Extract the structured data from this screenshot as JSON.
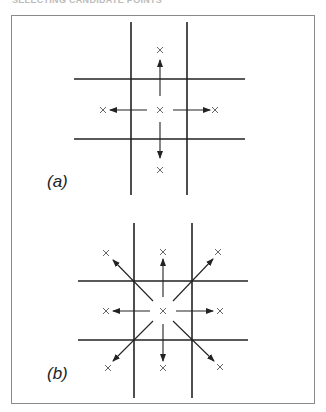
{
  "header": {
    "title": "SELECTING CANDIDATE POINTS"
  },
  "panels": [
    {
      "id": "a",
      "label": "(a)",
      "description": "4-neighbour search: center point with arrows to up, down, left, right candidates",
      "directions": [
        "up",
        "down",
        "left",
        "right"
      ]
    },
    {
      "id": "b",
      "label": "(b)",
      "description": "8-neighbour search: center point with arrows to all 8 surrounding candidates",
      "directions": [
        "up",
        "down",
        "left",
        "right",
        "up-left",
        "up-right",
        "down-left",
        "down-right"
      ]
    }
  ],
  "colors": {
    "line": "#222222",
    "frame": "#8a8a8a",
    "marker": "#555555"
  }
}
